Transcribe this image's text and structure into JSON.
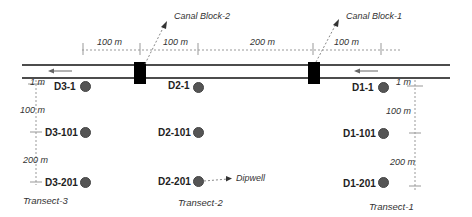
{
  "diagram": {
    "colors": {
      "line": "#111111",
      "dashed": "#999999",
      "well": "#555555",
      "block": "#000000"
    },
    "callouts": {
      "canal_block_2": "Canal Block-2",
      "canal_block_1": "Canal Block-1",
      "dipwell": "Dipwell"
    },
    "top_dimensions": [
      "100 m",
      "100 m",
      "200 m",
      "100 m"
    ],
    "left_scale": {
      "top": "1 m",
      "mid": "100 m",
      "bottom": "200 m"
    },
    "right_scale": {
      "top": "1 m",
      "mid": "100 m",
      "bottom": "200 m"
    },
    "transects": [
      {
        "name": "Transect-3",
        "wells": [
          "D3-1",
          "D3-101",
          "D3-201"
        ]
      },
      {
        "name": "Transect-2",
        "wells": [
          "D2-1",
          "D2-101",
          "D2-201"
        ]
      },
      {
        "name": "Transect-1",
        "wells": [
          "D1-1",
          "D1-101",
          "D1-201"
        ]
      }
    ],
    "flow_direction": "left-arrow"
  }
}
